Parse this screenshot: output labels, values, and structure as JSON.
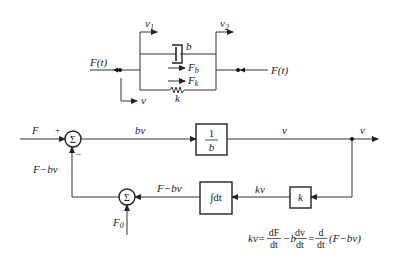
{
  "mechanical": {
    "force_left": "F(t)",
    "force_right": "F(t)",
    "v1": "v",
    "v1_sub": "1",
    "v2": "v",
    "v2_sub": "2",
    "damper": "b",
    "spring": "k",
    "fb": "F",
    "fb_sub": "b",
    "fk": "F",
    "fk_sub": "k",
    "v": "v"
  },
  "block": {
    "input": "F",
    "plus": "+",
    "minus": "−",
    "sum_symbol": "Σ",
    "bv": "bv",
    "gain_num": "1",
    "gain_den": "b",
    "v_mid": "v",
    "v_out": "v",
    "feedback_left": "F−bv",
    "feedback_mid": "F−bv",
    "kv": "kv",
    "k_gain": "k",
    "integrator": "∫dt",
    "f0": "F",
    "f0_sub": "0"
  },
  "equation": {
    "lhs": "kv=",
    "t1_num": "dF",
    "t1_den": "dt",
    "minus_b": "−b",
    "t2_num": "dv",
    "t2_den": "dt",
    "eq": "=",
    "t3_num": "d",
    "t3_den": "dt",
    "paren": "(F−bv)"
  }
}
